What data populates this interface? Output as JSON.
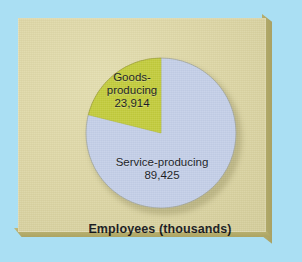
{
  "figure": {
    "caption": "Employees (thousands)",
    "panel_color": "#ded8a8",
    "backdrop_color": "#aadff3",
    "bevel_color": "#b0a868"
  },
  "chart_data": {
    "type": "pie",
    "title": "Employees (thousands)",
    "xlabel": "",
    "ylabel": "",
    "start_angle_deg": 0,
    "direction": "counterclockwise",
    "legend_position": "none",
    "grid": false,
    "units": "thousands of employees",
    "total": 113339,
    "categories": [
      "Goods-producing",
      "Service-producing"
    ],
    "values": [
      23914,
      89425
    ],
    "value_labels": [
      "23,914",
      "89,425"
    ],
    "percentages": [
      21.1,
      78.9
    ],
    "colors": [
      "#c3cc3c",
      "#c4cfe8"
    ],
    "slices": [
      {
        "label": "Goods-producing",
        "label_line1": "Goods-",
        "label_line2": "producing",
        "value": 23914,
        "value_label": "23,914",
        "percent": 21.1,
        "color": "#c3cc3c"
      },
      {
        "label": "Service-producing",
        "label_line1": "Service-producing",
        "label_line2": "",
        "value": 89425,
        "value_label": "89,425",
        "percent": 78.9,
        "color": "#c4cfe8"
      }
    ]
  }
}
